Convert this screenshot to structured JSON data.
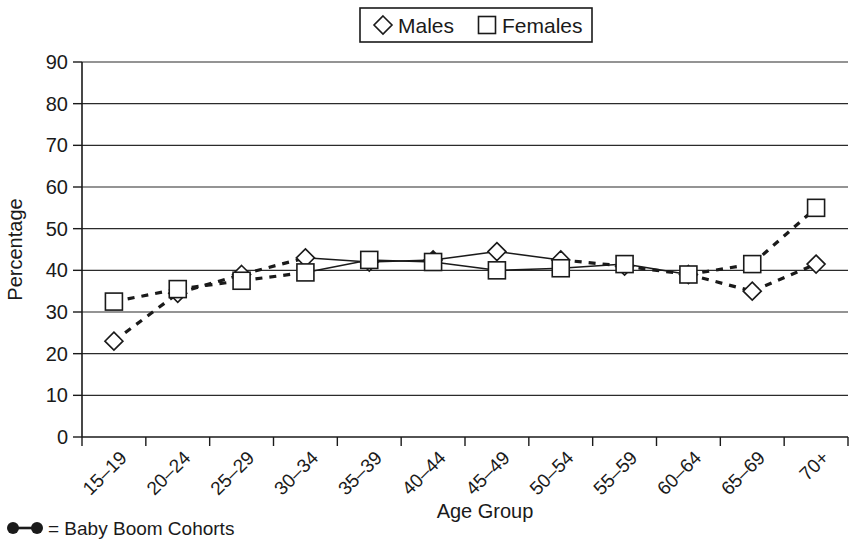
{
  "chart_data": {
    "type": "line",
    "title": "",
    "xlabel": "Age Group",
    "ylabel": "Percentage",
    "ylim": [
      0,
      90
    ],
    "ytick_step": 10,
    "yticks": [
      "0",
      "10",
      "20",
      "30",
      "40",
      "50",
      "60",
      "70",
      "80",
      "90"
    ],
    "grid": true,
    "grid_axis": "y",
    "legend_position": "top-center",
    "categories": [
      "15–19",
      "20–24",
      "25–29",
      "30–34",
      "35–39",
      "40–44",
      "45–49",
      "50–54",
      "55–59",
      "60–64",
      "65–69",
      "70+"
    ],
    "series": [
      {
        "name": "Males",
        "marker": "diamond",
        "values": [
          23.0,
          34.5,
          39.0,
          43.0,
          42.0,
          42.5,
          44.5,
          42.5,
          41.0,
          39.0,
          35.0,
          41.5
        ]
      },
      {
        "name": "Females",
        "marker": "square",
        "values": [
          32.5,
          35.5,
          37.5,
          39.5,
          42.5,
          42.0,
          40.0,
          40.5,
          41.5,
          39.0,
          41.5,
          55.0
        ]
      }
    ],
    "line_styles": {
      "dashed_note": "Dashed thick segments mark the Baby Boom cohorts",
      "males_solid_range": [
        3,
        7
      ],
      "females_solid_range": [
        3,
        9
      ]
    },
    "annotations": {
      "footnote": "= Baby Boom Cohorts"
    }
  },
  "legend": {
    "items": [
      {
        "label": "Males",
        "marker": "diamond"
      },
      {
        "label": "Females",
        "marker": "square"
      }
    ]
  },
  "footnote": {
    "text": "= Baby Boom Cohorts"
  },
  "colors": {
    "ink": "#1a1a1a",
    "background": "#ffffff"
  }
}
